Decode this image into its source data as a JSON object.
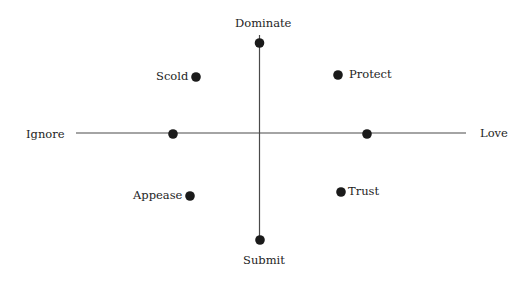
{
  "diagram": {
    "type": "quadrant-map",
    "axes": {
      "vertical": {
        "top": "Dominate",
        "bottom": "Submit"
      },
      "horizontal": {
        "left": "Ignore",
        "right": "Love"
      }
    },
    "points": [
      {
        "label": "Dominate",
        "x": 259,
        "y": 43
      },
      {
        "label": "Submit",
        "x": 260,
        "y": 240
      },
      {
        "label": "Ignore",
        "x": 173,
        "y": 133
      },
      {
        "label": "Love",
        "x": 367,
        "y": 133
      },
      {
        "label": "Scold",
        "x": 196,
        "y": 77
      },
      {
        "label": "Protect",
        "x": 338,
        "y": 75
      },
      {
        "label": "Appease",
        "x": 190,
        "y": 196
      },
      {
        "label": "Trust",
        "x": 341,
        "y": 192
      }
    ],
    "labels": {
      "dominate": "Dominate",
      "submit": "Submit",
      "ignore": "Ignore",
      "love": "Love",
      "scold": "Scold",
      "protect": "Protect",
      "appease": "Appease",
      "trust": "Trust"
    },
    "colors": {
      "line": "#444444",
      "dot": "#1a1a1a",
      "text": "#1e1e1e"
    }
  }
}
